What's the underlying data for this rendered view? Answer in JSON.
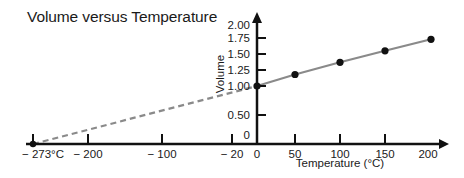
{
  "chart_data": {
    "type": "line",
    "title": "Volume versus Temperature",
    "xlabel": "Temperature (°C)",
    "ylabel": "Volume",
    "xlim": [
      -273,
      200
    ],
    "ylim": [
      0,
      2.0
    ],
    "grid": false,
    "legend": "none",
    "x_ticks": [
      {
        "value": -273,
        "label": "− 273°C",
        "mark": true
      },
      {
        "value": -200,
        "label": "− 200",
        "mark": true
      },
      {
        "value": -100,
        "label": "− 100",
        "mark": true
      },
      {
        "value": -20,
        "label": "− 20",
        "mark": true
      },
      {
        "value": 0,
        "label": "0",
        "mark": false
      },
      {
        "value": 50,
        "label": "50",
        "mark": true
      },
      {
        "value": 100,
        "label": "100",
        "mark": true
      },
      {
        "value": 150,
        "label": "150",
        "mark": true
      },
      {
        "value": 200,
        "label": "200",
        "mark": false
      }
    ],
    "y_ticks": [
      {
        "value": 0,
        "label": "0",
        "mark": false
      },
      {
        "value": 0.5,
        "label": "0.50",
        "mark": true
      },
      {
        "value": 1.0,
        "label": "1.00",
        "mark": true
      },
      {
        "value": 1.25,
        "label": "1.25",
        "mark": true
      },
      {
        "value": 1.5,
        "label": "1.50",
        "mark": true
      },
      {
        "value": 1.75,
        "label": "1.75",
        "mark": true
      },
      {
        "value": 2.0,
        "label": "2.00",
        "mark": false
      }
    ],
    "series": [
      {
        "name": "measured",
        "style": "solid",
        "color": "#8a8a8a",
        "markers": true,
        "x": [
          0,
          50,
          100,
          150,
          200
        ],
        "y": [
          1.0,
          1.18,
          1.37,
          1.55,
          1.73
        ]
      },
      {
        "name": "extrapolated",
        "style": "dashed",
        "color": "#8a8a8a",
        "markers": false,
        "x": [
          -273,
          0
        ],
        "y": [
          0,
          1.0
        ]
      }
    ],
    "annotations": [
      {
        "text": "− 273°C",
        "x": -273,
        "y": 0,
        "marker": true
      }
    ],
    "colors": {
      "axis": "#111111",
      "marker": "#111111",
      "line": "#8a8a8a"
    }
  }
}
